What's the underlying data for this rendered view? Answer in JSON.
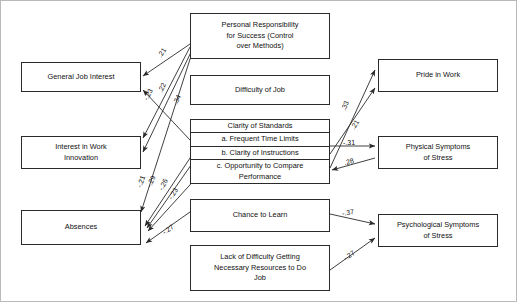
{
  "diagram": {
    "type": "path-diagram",
    "title": "",
    "nodes": {
      "general_job_interest": {
        "label": "General Job Interest"
      },
      "interest_in_work_innovation": {
        "label": "Interest in Work\nInnovation"
      },
      "absences": {
        "label": "Absences"
      },
      "personal_responsibility": {
        "label": "Personal Responsibility\nfor Success (Control\nover Methods)"
      },
      "difficulty_of_job": {
        "label": "Difficulty of Job"
      },
      "clarity_of_standards": {
        "header": "Clarity of Standards",
        "items": [
          "a. Frequent Time Limits",
          "b. Clarity of Instructions",
          "c. Opportunity to Compare\nPerformance"
        ]
      },
      "chance_to_learn": {
        "label": "Chance to Learn"
      },
      "lack_of_difficulty": {
        "label": "Lack of Difficulty Getting\nNecessary Resources to Do\nJob"
      },
      "pride_in_work": {
        "label": "Pride in Work"
      },
      "physical_symptoms": {
        "label": "Physical Symptoms\nof Stress"
      },
      "psychological_symptoms": {
        "label": "Psychological Symptoms\nof Stress"
      }
    },
    "edges": [
      {
        "id": "e1",
        "from": "personal_responsibility",
        "to": "general_job_interest",
        "coefficient": ".21"
      },
      {
        "id": "e2",
        "from": "clarity_of_standards",
        "to": "general_job_interest",
        "coefficient": "-.23"
      },
      {
        "id": "e3",
        "from": "personal_responsibility",
        "to": "interest_in_work_innovation",
        "coefficient": ".22"
      },
      {
        "id": "e4",
        "from": "personal_responsibility",
        "to": "interest_in_work_innovation",
        "coefficient": ".34"
      },
      {
        "id": "e5",
        "from": "personal_responsibility",
        "to": "absences",
        "coefficient": "-.21"
      },
      {
        "id": "e6",
        "from": "clarity_of_standards",
        "to": "absences",
        "coefficient": "-.29"
      },
      {
        "id": "e7",
        "from": "clarity_of_standards",
        "to": "absences",
        "coefficient": "-.26"
      },
      {
        "id": "e8",
        "from": "clarity_of_standards",
        "to": "absences",
        "coefficient": "-.23"
      },
      {
        "id": "e9",
        "from": "chance_to_learn",
        "to": "absences",
        "coefficient": "-.27"
      },
      {
        "id": "e10",
        "from": "clarity_of_standards",
        "to": "pride_in_work",
        "coefficient": ".33"
      },
      {
        "id": "e11",
        "from": "clarity_of_standards",
        "to": "pride_in_work",
        "coefficient": ".21"
      },
      {
        "id": "e12",
        "from": "clarity_of_standards",
        "to": "physical_symptoms",
        "coefficient": "-.31"
      },
      {
        "id": "e13",
        "from": "physical_symptoms",
        "to": "clarity_of_standards",
        "coefficient": ".28"
      },
      {
        "id": "e14",
        "from": "chance_to_learn",
        "to": "psychological_symptoms",
        "coefficient": "-.37"
      },
      {
        "id": "e15",
        "from": "lack_of_difficulty",
        "to": "psychological_symptoms",
        "coefficient": "-.27"
      }
    ],
    "colors": {
      "stroke": "#2a2a2a",
      "text": "#111111",
      "background": "#ffffff",
      "frame": "#b9b9b9"
    }
  }
}
